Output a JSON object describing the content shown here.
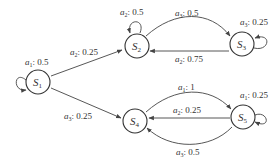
{
  "diagram": {
    "type": "state-transition-graph",
    "states": [
      {
        "id": "S1",
        "name": "S",
        "sub": "1"
      },
      {
        "id": "S2",
        "name": "S",
        "sub": "2"
      },
      {
        "id": "S3",
        "name": "S",
        "sub": "3"
      },
      {
        "id": "S4",
        "name": "S",
        "sub": "4"
      },
      {
        "id": "S5",
        "name": "S",
        "sub": "5"
      }
    ],
    "transitions": [
      {
        "from": "S1",
        "to": "S1",
        "action": "a",
        "sub": "1",
        "prob": ": 0.5"
      },
      {
        "from": "S1",
        "to": "S2",
        "action": "a",
        "sub": "2",
        "prob": ": 0.25"
      },
      {
        "from": "S1",
        "to": "S4",
        "action": "a",
        "sub": "3",
        "prob": ": 0.25"
      },
      {
        "from": "S2",
        "to": "S2",
        "action": "a",
        "sub": "2",
        "prob": ": 0.5"
      },
      {
        "from": "S2",
        "to": "S3",
        "action": "a",
        "sub": "3",
        "prob": ": 0.5"
      },
      {
        "from": "S3",
        "to": "S2",
        "action": "a",
        "sub": "2",
        "prob": ": 0.75"
      },
      {
        "from": "S3",
        "to": "S3",
        "action": "a",
        "sub": "3",
        "prob": ": 0.25"
      },
      {
        "from": "S4",
        "to": "S5",
        "action": "a",
        "sub": "1",
        "prob": ": 1"
      },
      {
        "from": "S5",
        "to": "S4",
        "action": "a",
        "sub": "2",
        "prob": ": 0.25"
      },
      {
        "from": "S5",
        "to": "S4",
        "action": "a",
        "sub": "3",
        "prob": ": 0.5"
      },
      {
        "from": "S5",
        "to": "S5",
        "action": "a",
        "sub": "1",
        "prob": ": 0.25"
      }
    ]
  }
}
